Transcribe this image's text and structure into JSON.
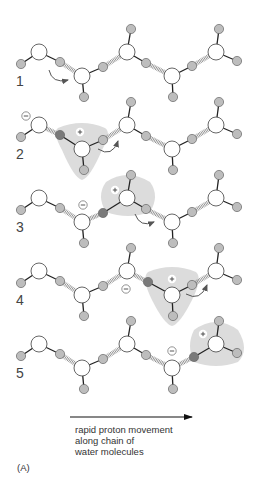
{
  "figure": {
    "panel_label": "(A)",
    "caption_lines": [
      "rapid proton movement",
      "along chain of",
      "water molecules"
    ],
    "colors": {
      "oxygen_fill": "#ffffff",
      "oxygen_stroke": "#555555",
      "hydrogen_fill": "#bdbdbd",
      "hydrogen_dark_fill": "#7a7a7a",
      "hydrogen_stroke": "#666666",
      "bond": "#222222",
      "hbond": "#666666",
      "shade": "#dcdcdc",
      "arrow": "#555555"
    },
    "arrow": {
      "x1": 70,
      "x2": 192,
      "y": 417
    },
    "rows": [
      {
        "label": "1",
        "dy": 0,
        "minus_at": null,
        "plus_at": null,
        "shade": null,
        "dark_h": null,
        "curved_arrow": {
          "d": "M49,70 Q52,84 68,80"
        }
      },
      {
        "label": "2",
        "dy": 73,
        "minus_at": [
          26,
          116
        ],
        "plus_at": [
          80,
          132
        ],
        "shade": "M58,128 Q82,118 105,128 Q112,132 102,150 Q90,178 82,180 Q74,178 62,150 Q52,132 58,128 Z",
        "dark_h": [
          61,
          135
        ],
        "curved_arrow": {
          "d": "M98,149 Q112,158 118,141"
        }
      },
      {
        "label": "3",
        "dy": 146,
        "minus_at": [
          83,
          205
        ],
        "plus_at": [
          115,
          190
        ],
        "shade": "M106,182 Q127,168 150,182 Q160,196 150,212 Q128,220 106,212 Q96,196 106,182 Z",
        "dark_h": [
          104,
          209
        ],
        "curved_arrow": {
          "d": "M135,214 Q140,228 154,222"
        }
      },
      {
        "label": "4",
        "dy": 219,
        "minus_at": [
          126,
          289
        ],
        "plus_at": [
          172,
          279
        ],
        "shade": "M148,272 Q172,262 196,272 Q203,278 192,300 Q180,324 172,326 Q164,324 152,300 Q141,278 148,272 Z",
        "dark_h": [
          148,
          282
        ],
        "curved_arrow": {
          "d": "M186,294 Q200,302 207,285"
        }
      },
      {
        "label": "5",
        "dy": 292,
        "minus_at": [
          172,
          351
        ],
        "plus_at": [
          203,
          334
        ],
        "shade": "M194,330 Q216,314 238,330 Q250,350 238,362 Q216,370 194,362 Q186,346 194,330 Z",
        "dark_h": [
          194,
          357
        ],
        "curved_arrow": null
      }
    ],
    "base_molecules": [
      {
        "o": [
          39,
          52
        ],
        "h": [
          [
            21,
            64
          ],
          [
            60,
            62
          ]
        ]
      },
      {
        "o": [
          82,
          76
        ],
        "h": [
          [
            103,
            67
          ],
          [
            84,
            97
          ]
        ]
      },
      {
        "o": [
          127,
          52
        ],
        "h": [
          [
            131,
            29
          ],
          [
            146,
            63
          ]
        ]
      },
      {
        "o": [
          172,
          76
        ],
        "h": [
          [
            173,
            97
          ],
          [
            192,
            66
          ]
        ]
      },
      {
        "o": [
          216,
          52
        ],
        "h": [
          [
            219,
            29
          ],
          [
            237,
            61
          ]
        ]
      }
    ],
    "base_hbonds": [
      [
        [
          60,
          62
        ],
        [
          82,
          76
        ]
      ],
      [
        [
          103,
          67
        ],
        [
          127,
          52
        ]
      ],
      [
        [
          146,
          63
        ],
        [
          172,
          76
        ]
      ],
      [
        [
          192,
          66
        ],
        [
          216,
          52
        ]
      ]
    ],
    "row_overrides": {
      "2": {
        "molecules": [
          {
            "o": [
              39,
              52
            ],
            "h": [
              [
                21,
                64
              ]
            ]
          },
          {
            "o": [
              82,
              76
            ],
            "h": [
              [
                60,
                62
              ],
              [
                103,
                67
              ],
              [
                84,
                97
              ]
            ]
          },
          {
            "o": [
              127,
              52
            ],
            "h": [
              [
                131,
                29
              ],
              [
                146,
                63
              ]
            ]
          },
          {
            "o": [
              172,
              76
            ],
            "h": [
              [
                173,
                97
              ],
              [
                192,
                66
              ]
            ]
          },
          {
            "o": [
              216,
              52
            ],
            "h": [
              [
                219,
                29
              ],
              [
                237,
                61
              ]
            ]
          }
        ],
        "hbonds": [
          [
            [
              60,
              62
            ],
            [
              39,
              52
            ]
          ],
          [
            [
              103,
              67
            ],
            [
              127,
              52
            ]
          ],
          [
            [
              146,
              63
            ],
            [
              172,
              76
            ]
          ],
          [
            [
              192,
              66
            ],
            [
              216,
              52
            ]
          ]
        ]
      },
      "3": {
        "molecules": [
          {
            "o": [
              39,
              52
            ],
            "h": [
              [
                21,
                64
              ],
              [
                60,
                62
              ]
            ]
          },
          {
            "o": [
              82,
              76
            ],
            "h": [
              [
                84,
                97
              ]
            ]
          },
          {
            "o": [
              127,
              52
            ],
            "h": [
              [
                103,
                67
              ],
              [
                131,
                29
              ],
              [
                146,
                63
              ]
            ]
          },
          {
            "o": [
              172,
              76
            ],
            "h": [
              [
                173,
                97
              ],
              [
                192,
                66
              ]
            ]
          },
          {
            "o": [
              216,
              52
            ],
            "h": [
              [
                219,
                29
              ],
              [
                237,
                61
              ]
            ]
          }
        ],
        "hbonds": [
          [
            [
              60,
              62
            ],
            [
              82,
              76
            ]
          ],
          [
            [
              103,
              67
            ],
            [
              82,
              76
            ]
          ],
          [
            [
              146,
              63
            ],
            [
              172,
              76
            ]
          ],
          [
            [
              192,
              66
            ],
            [
              216,
              52
            ]
          ]
        ]
      },
      "4": {
        "molecules": [
          {
            "o": [
              39,
              52
            ],
            "h": [
              [
                21,
                64
              ],
              [
                60,
                62
              ]
            ]
          },
          {
            "o": [
              82,
              76
            ],
            "h": [
              [
                103,
                67
              ],
              [
                84,
                97
              ]
            ]
          },
          {
            "o": [
              127,
              52
            ],
            "h": [
              [
                131,
                29
              ]
            ]
          },
          {
            "o": [
              172,
              76
            ],
            "h": [
              [
                148,
                63
              ],
              [
                173,
                97
              ],
              [
                192,
                66
              ]
            ]
          },
          {
            "o": [
              216,
              52
            ],
            "h": [
              [
                219,
                29
              ],
              [
                237,
                61
              ]
            ]
          }
        ],
        "hbonds": [
          [
            [
              60,
              62
            ],
            [
              82,
              76
            ]
          ],
          [
            [
              103,
              67
            ],
            [
              127,
              52
            ]
          ],
          [
            [
              148,
              63
            ],
            [
              127,
              52
            ]
          ],
          [
            [
              192,
              66
            ],
            [
              216,
              52
            ]
          ]
        ]
      },
      "5": {
        "molecules": [
          {
            "o": [
              39,
              52
            ],
            "h": [
              [
                21,
                64
              ],
              [
                60,
                62
              ]
            ]
          },
          {
            "o": [
              82,
              76
            ],
            "h": [
              [
                103,
                67
              ],
              [
                84,
                97
              ]
            ]
          },
          {
            "o": [
              127,
              52
            ],
            "h": [
              [
                131,
                29
              ],
              [
                146,
                63
              ]
            ]
          },
          {
            "o": [
              172,
              76
            ],
            "h": [
              [
                173,
                97
              ]
            ]
          },
          {
            "o": [
              216,
              52
            ],
            "h": [
              [
                194,
                65
              ],
              [
                219,
                29
              ],
              [
                237,
                61
              ]
            ]
          }
        ],
        "hbonds": [
          [
            [
              60,
              62
            ],
            [
              82,
              76
            ]
          ],
          [
            [
              103,
              67
            ],
            [
              127,
              52
            ]
          ],
          [
            [
              146,
              63
            ],
            [
              172,
              76
            ]
          ],
          [
            [
              194,
              65
            ],
            [
              172,
              76
            ]
          ]
        ]
      }
    }
  }
}
